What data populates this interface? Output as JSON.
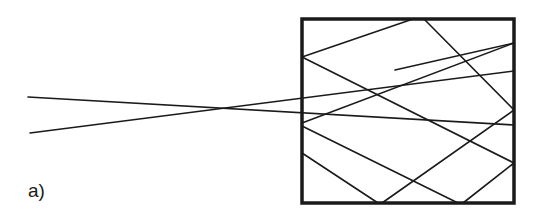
{
  "figure": {
    "panel_label": "a)",
    "colors": {
      "stroke": "#1a1a1a",
      "background": "#ffffff"
    },
    "box": {
      "x1": 302,
      "y1": 19,
      "x2": 514,
      "y2": 203,
      "stroke_width": 3.5
    },
    "incident_rays": [
      {
        "name": "ray-1",
        "x1": 28,
        "y1": 97,
        "x2": 514,
        "y2": 125
      },
      {
        "name": "ray-2",
        "x1": 30,
        "y1": 133,
        "x2": 514,
        "y2": 71
      }
    ],
    "reflected_segments": [
      {
        "x1": 413,
        "y1": 19,
        "x2": 302,
        "y2": 57
      },
      {
        "x1": 302,
        "y1": 57,
        "x2": 514,
        "y2": 163
      },
      {
        "x1": 424,
        "y1": 19,
        "x2": 514,
        "y2": 110
      },
      {
        "x1": 514,
        "y1": 110,
        "x2": 382,
        "y2": 203
      },
      {
        "x1": 302,
        "y1": 153,
        "x2": 378,
        "y2": 203
      },
      {
        "x1": 302,
        "y1": 126,
        "x2": 458,
        "y2": 203
      },
      {
        "x1": 514,
        "y1": 163,
        "x2": 463,
        "y2": 203
      },
      {
        "x1": 302,
        "y1": 123,
        "x2": 514,
        "y2": 43
      },
      {
        "x1": 514,
        "y1": 43,
        "x2": 395,
        "y2": 70
      }
    ]
  }
}
